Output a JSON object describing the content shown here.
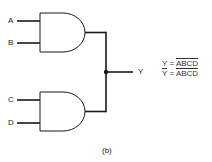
{
  "diagram": {
    "type": "logic-circuit",
    "gates": [
      {
        "id": "gate-1",
        "type": "AND",
        "inputs": [
          "A",
          "B"
        ]
      },
      {
        "id": "gate-2",
        "type": "AND",
        "inputs": [
          "C",
          "D"
        ]
      }
    ],
    "output_label": "Y",
    "connection": "wired outputs joined at junction to Y"
  },
  "labels": {
    "a": "A",
    "b": "B",
    "c": "C",
    "d": "D",
    "y": "Y"
  },
  "equations": {
    "line1_lhs": "Y",
    "line1_eq": " = ",
    "line1_rhs": "ABCD",
    "line2_lhs": "Y",
    "line2_eq": " = ",
    "line2_rhs": "ABCD"
  },
  "caption": "(b)",
  "colors": {
    "line": "#1a1a1a",
    "text": "#333333",
    "background": "#ffffff"
  }
}
